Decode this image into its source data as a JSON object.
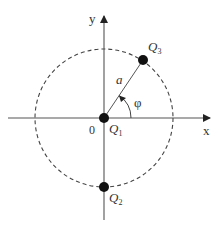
{
  "diagram": {
    "axes": {
      "x_label": "x",
      "y_label": "y",
      "origin_label": "0"
    },
    "circle": {
      "style": "dashed",
      "radius_label": "a"
    },
    "angle_label": "φ",
    "charges": [
      {
        "id": "Q1",
        "letter": "Q",
        "index": "1",
        "position": "origin"
      },
      {
        "id": "Q2",
        "letter": "Q",
        "index": "2",
        "position": "bottom of circle"
      },
      {
        "id": "Q3",
        "letter": "Q",
        "index": "3",
        "position": "on circle at angle φ"
      }
    ],
    "colors": {
      "line": "#555555",
      "charge": "#111111",
      "circle": "#444444"
    }
  }
}
